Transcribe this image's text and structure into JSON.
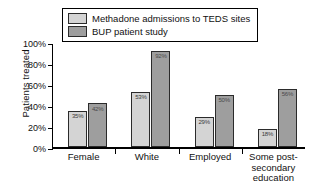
{
  "chart_data": {
    "type": "bar",
    "title": "",
    "xlabel": "",
    "ylabel": "Patients treated",
    "categories": [
      "Female",
      "White",
      "Employed",
      "Some post-secondary education"
    ],
    "category_lines": [
      [
        "Female"
      ],
      [
        "White"
      ],
      [
        "Employed"
      ],
      [
        "Some post-",
        "secondary",
        "education"
      ]
    ],
    "series": [
      {
        "name": "Methadone admissions to TEDS sites",
        "color": "#d4d4d4",
        "values": [
          35,
          53,
          29,
          18
        ],
        "labels": [
          "35%",
          "53%",
          "29%",
          "18%"
        ]
      },
      {
        "name": "BUP patient study",
        "color": "#9e9e9e",
        "values": [
          42,
          92,
          50,
          56
        ],
        "labels": [
          "42%",
          "92%",
          "50%",
          "56%"
        ]
      }
    ],
    "ylim": [
      0,
      100
    ],
    "yticks": [
      0,
      20,
      40,
      60,
      80,
      100
    ],
    "ytick_labels": [
      "0%",
      "20%",
      "40%",
      "60%",
      "80%",
      "100%"
    ],
    "grid": false,
    "legend_position": "top-center",
    "value_labels_inside_bars": true
  },
  "axis": {
    "y_title": "Patients treated",
    "y_tick_labels": [
      "100%",
      "80%",
      "60%",
      "40%",
      "20%",
      "0%"
    ]
  },
  "legend": {
    "entries": [
      {
        "label": "Methadone admissions to TEDS sites",
        "swatch": "light-gray-swatch"
      },
      {
        "label": "BUP patient study",
        "swatch": "medium-gray-swatch"
      }
    ]
  }
}
